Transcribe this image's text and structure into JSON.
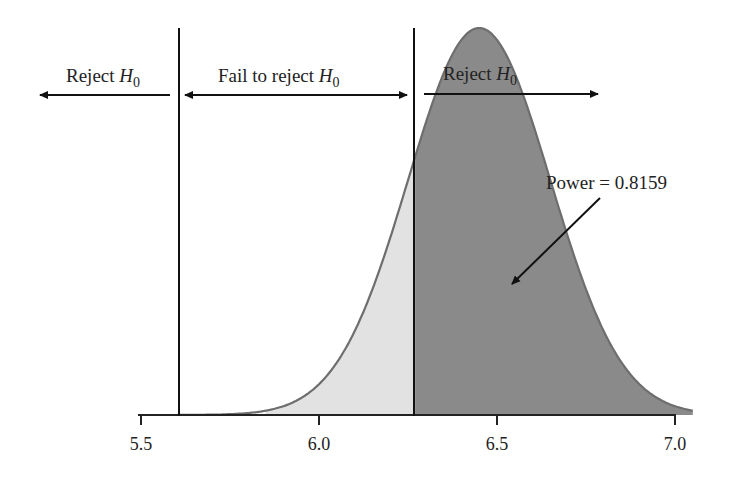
{
  "chart_data": {
    "type": "area",
    "title": "",
    "xlabel": "",
    "ylabel": "",
    "xlim": [
      5.5,
      7.0
    ],
    "x_ticks": [
      "5.5",
      "6.0",
      "6.5",
      "7.0"
    ],
    "x_tick_values": [
      5.5,
      6.0,
      6.5,
      7.0
    ],
    "grid": false,
    "distribution": {
      "kind": "normal",
      "mean": 6.45,
      "sd": 0.2
    },
    "critical_values": [
      5.615,
      6.27
    ],
    "shaded_regions": [
      {
        "name": "beta (fail to reject under alternative)",
        "from": 5.9,
        "to": 6.27,
        "color": "#e2e2e2"
      },
      {
        "name": "power",
        "from": 6.27,
        "to": 7.05,
        "color": "#8a8a8a"
      }
    ],
    "annotations": {
      "reject_left": "Reject ",
      "fail_to_reject": "Fail to reject ",
      "reject_right": "Reject ",
      "hypothesis": "H",
      "hypothesis_sub": "0",
      "power_label": "Power = 0.8159"
    },
    "power": 0.8159
  },
  "colors": {
    "power_fill": "#8a8a8a",
    "beta_fill": "#e2e2e2",
    "curve_stroke": "#6e6e6e",
    "axis": "#222222"
  }
}
